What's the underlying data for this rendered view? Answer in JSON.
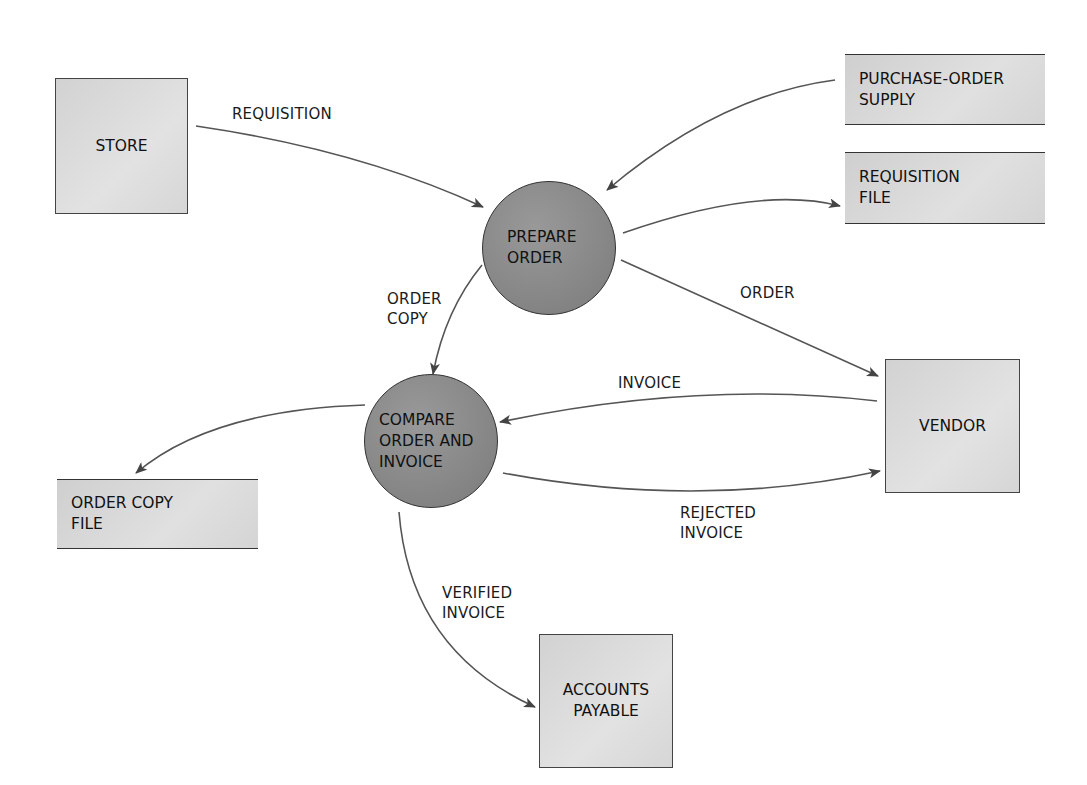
{
  "diagram": {
    "type": "data-flow-diagram",
    "external_entities": [
      {
        "id": "store",
        "label": "STORE"
      },
      {
        "id": "vendor",
        "label": "VENDOR"
      },
      {
        "id": "accounts_payable",
        "label_line1": "ACCOUNTS",
        "label_line2": "PAYABLE"
      }
    ],
    "processes": [
      {
        "id": "prepare_order",
        "label_line1": "PREPARE",
        "label_line2": "ORDER"
      },
      {
        "id": "compare",
        "label_line1": "COMPARE",
        "label_line2": "ORDER AND",
        "label_line3": "INVOICE"
      }
    ],
    "data_stores": [
      {
        "id": "po_supply",
        "label_line1": "PURCHASE-ORDER",
        "label_line2": "SUPPLY"
      },
      {
        "id": "req_file",
        "label_line1": "REQUISITION",
        "label_line2": "FILE"
      },
      {
        "id": "order_copy_file",
        "label_line1": "ORDER COPY",
        "label_line2": "FILE"
      }
    ],
    "flows": [
      {
        "from": "store",
        "to": "prepare_order",
        "label_line1": "REQUISITION"
      },
      {
        "from": "po_supply",
        "to": "prepare_order",
        "label_line1": ""
      },
      {
        "from": "prepare_order",
        "to": "req_file",
        "label_line1": ""
      },
      {
        "from": "prepare_order",
        "to": "vendor",
        "label_line1": "ORDER"
      },
      {
        "from": "prepare_order",
        "to": "compare",
        "label_line1": "ORDER",
        "label_line2": "COPY"
      },
      {
        "from": "vendor",
        "to": "compare",
        "label_line1": "INVOICE"
      },
      {
        "from": "compare",
        "to": "vendor",
        "label_line1": "REJECTED",
        "label_line2": "INVOICE"
      },
      {
        "from": "compare",
        "to": "order_copy_file",
        "label_line1": ""
      },
      {
        "from": "compare",
        "to": "accounts_payable",
        "label_line1": "VERIFIED",
        "label_line2": "INVOICE"
      }
    ],
    "colors": {
      "entity_fill": "#dcdcdc",
      "process_fill": "#8a8a8a",
      "line": "#444444",
      "text": "#111111"
    }
  }
}
